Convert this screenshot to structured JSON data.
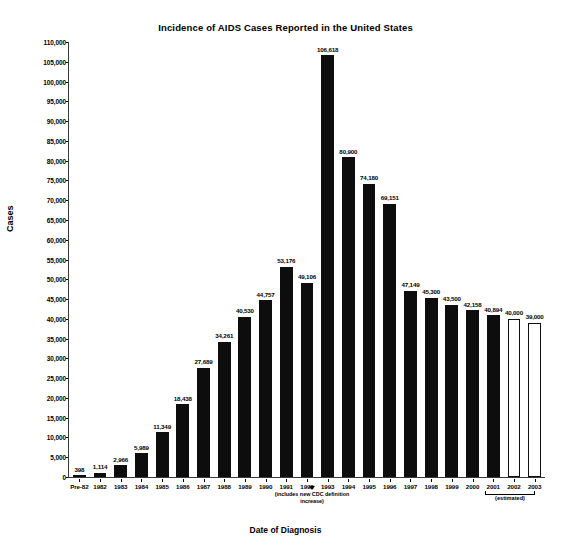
{
  "chart": {
    "title": "Incidence of AIDS Cases Reported in the United States",
    "xlabel": "Date of Diagnosis",
    "ylabel": "Cases"
  },
  "annotations": {
    "cdc_note": "(includes new CDC definition increase)",
    "estimated_note": "(estimated)"
  },
  "chart_data": {
    "type": "bar",
    "title": "Incidence of AIDS Cases Reported in the United States",
    "xlabel": "Date of Diagnosis",
    "ylabel": "Cases",
    "ylim": [
      0,
      110000
    ],
    "ytick_step": 5000,
    "grid": false,
    "legend": null,
    "yticks": [
      "0",
      "5,000",
      "10,000",
      "15,000",
      "20,000",
      "25,000",
      "30,000",
      "35,000",
      "40,000",
      "45,000",
      "50,000",
      "55,000",
      "60,000",
      "65,000",
      "70,000",
      "75,000",
      "80,000",
      "85,000",
      "90,000",
      "95,000",
      "100,000",
      "105,000",
      "110,000"
    ],
    "categories": [
      "Pre-82",
      "1982",
      "1983",
      "1984",
      "1985",
      "1986",
      "1987",
      "1988",
      "1989",
      "1990",
      "1991",
      "1992",
      "1993",
      "1994",
      "1995",
      "1996",
      "1997",
      "1998",
      "1999",
      "2000",
      "2001",
      "2002",
      "2003"
    ],
    "values": [
      398,
      1114,
      2966,
      5989,
      11349,
      18438,
      27689,
      34261,
      40530,
      44757,
      53176,
      49106,
      106618,
      80900,
      74180,
      69151,
      47149,
      45300,
      43500,
      42158,
      40894,
      40000,
      39000
    ],
    "labels": [
      "398",
      "1,114",
      "2,966",
      "5,989",
      "11,349",
      "18,438",
      "27,689",
      "34,261",
      "40,530",
      "44,757",
      "53,176",
      "49,106",
      "106,618",
      "80,900",
      "74,180",
      "69,151",
      "47,149",
      "45,300",
      "43,500",
      "42,158",
      "40,894",
      "40,000",
      "39,000"
    ],
    "styles": [
      "filled",
      "filled",
      "filled",
      "filled",
      "filled",
      "filled",
      "filled",
      "filled",
      "filled",
      "filled",
      "filled",
      "filled",
      "filled",
      "filled",
      "filled",
      "filled",
      "filled",
      "filled",
      "filled",
      "filled",
      "filled",
      "hollow",
      "hollow"
    ],
    "annotations": [
      {
        "category": "1993",
        "text": "(includes new CDC definition increase)"
      },
      {
        "categories": [
          "2002",
          "2003"
        ],
        "text": "(estimated)"
      }
    ],
    "colors": {
      "bar_fill": "#0d0d0d",
      "bar_hollow_fill": "#ffffff",
      "bar_outline": "#0d0d0d",
      "axis": "#3a3a3a",
      "text": "#000000"
    }
  }
}
